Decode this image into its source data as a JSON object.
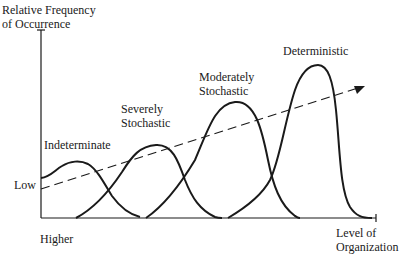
{
  "diagram": {
    "y_axis_label_line1": "Relative Frequency",
    "y_axis_label_line2": "of Occurrence",
    "y_axis_low_label": "Low",
    "x_axis_start_label": "Higher",
    "x_axis_end_label_line1": "Level of",
    "x_axis_end_label_line2": "Organization",
    "curves": [
      {
        "label_line1": "Indeterminate",
        "label_line2": ""
      },
      {
        "label_line1": "Severely",
        "label_line2": "Stochastic"
      },
      {
        "label_line1": "Moderately",
        "label_line2": "Stochastic"
      },
      {
        "label_line1": "Deterministic",
        "label_line2": ""
      }
    ],
    "trend_arrow": "dashed-arrow-increasing",
    "colors": {
      "line": "#1a1a1a",
      "background": "#ffffff"
    }
  }
}
